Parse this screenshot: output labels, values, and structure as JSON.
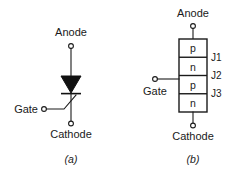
{
  "figure": {
    "width": 250,
    "height": 178,
    "background_color": "#ffffff",
    "line_color": "#1a1a1a",
    "fill_color": "#111111"
  },
  "panel_a": {
    "caption": "(a)",
    "description": "Schematic symbol of a thyristor",
    "terminals": {
      "anode": "Anode",
      "cathode": "Cathode",
      "gate": "Gate"
    }
  },
  "panel_b": {
    "caption": "(b)",
    "description": "Four-layer PNPN structure of a thyristor",
    "terminals": {
      "anode": "Anode",
      "cathode": "Cathode",
      "gate": "Gate"
    },
    "layers": [
      {
        "name": "p"
      },
      {
        "name": "n"
      },
      {
        "name": "p"
      },
      {
        "name": "n"
      }
    ],
    "junctions": [
      {
        "name": "J1"
      },
      {
        "name": "J2"
      },
      {
        "name": "J3"
      }
    ]
  }
}
